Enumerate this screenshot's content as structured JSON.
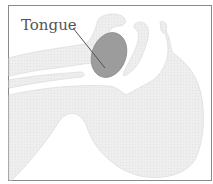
{
  "diagram": {
    "type": "anatomical-cross-section",
    "labels": [
      {
        "text": "Tongue",
        "target": "tongue"
      }
    ],
    "colors": {
      "frame": "#8a8a8a",
      "tissue": "#ececec",
      "tissue_edge": "#dcdcdc",
      "tongue": "#9a9a9a",
      "leader": "#555555",
      "label": "#555555",
      "background": "#ffffff"
    }
  }
}
